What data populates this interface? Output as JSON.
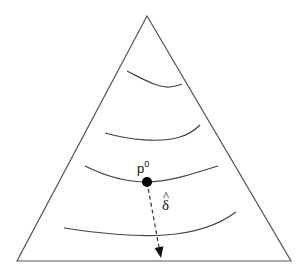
{
  "diagram": {
    "type": "simplex-contour",
    "shape": "triangle",
    "triangle": {
      "apex": [
        147,
        16
      ],
      "base_left": [
        17,
        261
      ],
      "base_right": [
        291,
        261
      ]
    },
    "contours": [
      {
        "id": "contour-1",
        "path": "M127,71 C145,80 158,88 170,87 C176,86 180,85 182,84"
      },
      {
        "id": "contour-2",
        "path": "M105,133 C130,140 160,143 180,137 C190,134 196,129 200,125"
      },
      {
        "id": "contour-3",
        "path": "M85,166 C105,176 125,182 147,182 C170,182 195,173 218,166"
      },
      {
        "id": "contour-4",
        "path": "M64,228 C100,234 140,237 165,235 C195,233 220,224 236,212"
      }
    ],
    "point": {
      "label": "p",
      "superscript": "0",
      "cx": 147,
      "cy": 182,
      "r": 5
    },
    "arrow": {
      "label": "δ",
      "accent": "^",
      "from": [
        147,
        182
      ],
      "to": [
        161,
        258
      ],
      "style": "dashed"
    },
    "colors": {
      "stroke": "#4a4a4a",
      "point": "#000000"
    }
  }
}
